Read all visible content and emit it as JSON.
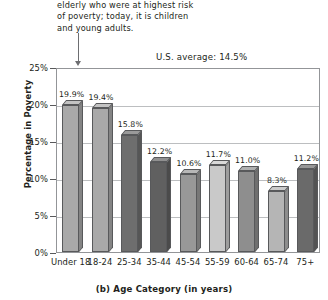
{
  "caption": {
    "lines": [
      "elderly who were at highest risk",
      "of poverty; today, it is children",
      "and young adults."
    ]
  },
  "annotation": {
    "us_average_label": "U.S. average: 14.5%",
    "us_average_value": 14.5
  },
  "chart_data": {
    "type": "bar",
    "title": "",
    "xlabel": "(b) Age Category (in years)",
    "ylabel": "Percentage in Poverty",
    "categories": [
      "Under 18",
      "18-24",
      "25-34",
      "35-44",
      "45-54",
      "55-59",
      "60-64",
      "65-74",
      "75+"
    ],
    "values": [
      19.9,
      19.4,
      15.8,
      12.2,
      10.6,
      11.7,
      11.0,
      8.3,
      11.2
    ],
    "value_labels": [
      "19.9%",
      "19.4%",
      "15.8%",
      "12.2%",
      "10.6%",
      "11.7%",
      "11.0%",
      "8.3%",
      "11.2%"
    ],
    "bar_colors": [
      "#a9a9a9",
      "#a9a9a9",
      "#6e6e6e",
      "#606060",
      "#989898",
      "#c9c9c9",
      "#8e8e8e",
      "#b5b5b5",
      "#6a6a6a"
    ],
    "ylim": [
      0,
      25
    ],
    "ytick_values": [
      0,
      5,
      10,
      15,
      20,
      25
    ],
    "ytick_labels": [
      "0%",
      "5%",
      "10%",
      "15%",
      "20%",
      "25%"
    ],
    "grid": true,
    "legend": "none",
    "reference_line": 14.5
  },
  "colors": {
    "axis": "#58595b",
    "grid": "#bcbec0",
    "text": "#231f20",
    "leader": "#6d6e71"
  }
}
